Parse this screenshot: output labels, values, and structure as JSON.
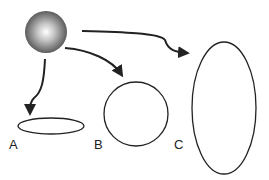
{
  "diagram": {
    "source": {
      "type": "sphere",
      "gradient_center": "#ffffff",
      "gradient_edge": "#555555"
    },
    "shapes": [
      {
        "label": "A",
        "type": "flat-ellipse"
      },
      {
        "label": "B",
        "type": "circle"
      },
      {
        "label": "C",
        "type": "tall-ellipse"
      }
    ],
    "colors": {
      "stroke": "#222222",
      "background": "#ffffff"
    }
  }
}
